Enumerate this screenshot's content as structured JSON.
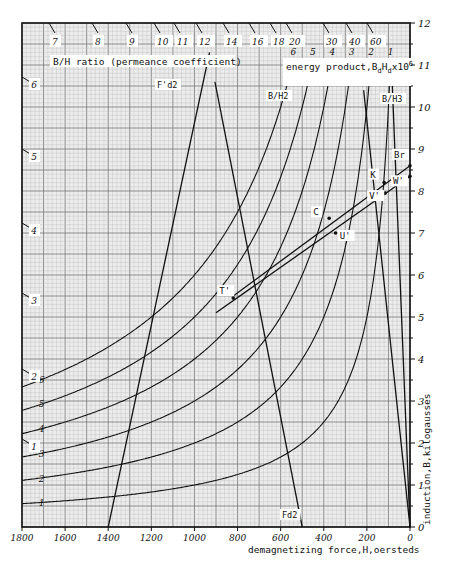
{
  "chart_data": {
    "type": "line",
    "title": "",
    "xlabel": "demagnetizing force,H,oersteds",
    "ylabel": "induction,B,kilogausses",
    "xlim": [
      1800,
      0
    ],
    "ylim": [
      0,
      12
    ],
    "x_ticks": [
      "1800",
      "1600",
      "1400",
      "1200",
      "1000",
      "800",
      "600",
      "400",
      "200",
      "0"
    ],
    "y_ticks": [
      "0",
      "1",
      "2",
      "3",
      "4",
      "5",
      "6",
      "7",
      "8",
      "9",
      "10",
      "11",
      "12"
    ],
    "grid": true,
    "legend_energy": "energy product,BdHdx10^6",
    "legend_bh": "B/H ratio (permeance coefficient)",
    "energy_product_curves": [
      {
        "label": "1",
        "value": 1
      },
      {
        "label": "2",
        "value": 2
      },
      {
        "label": "3",
        "value": 3
      },
      {
        "label": "4",
        "value": 4
      },
      {
        "label": "5",
        "value": 5
      },
      {
        "label": "6",
        "value": 6
      }
    ],
    "bh_ratio_lines_left": [
      "1",
      "2",
      "3",
      "4",
      "5",
      "6"
    ],
    "bh_ratio_lines_top": [
      "7",
      "8",
      "9",
      "10",
      "11",
      "12",
      "14",
      "16",
      "18",
      "20",
      "30",
      "40",
      "60"
    ],
    "series": [
      {
        "name": "demag line Br-T'",
        "points": [
          [
            0,
            8.6
          ],
          [
            820,
            5.5
          ]
        ]
      },
      {
        "name": "recoil line W'-T'",
        "points": [
          [
            0,
            8.35
          ],
          [
            900,
            5.1
          ]
        ]
      },
      {
        "name": "F'd2",
        "points": [
          [
            1400,
            0
          ],
          [
            930,
            11.3
          ]
        ]
      },
      {
        "name": "Fd2",
        "points": [
          [
            500,
            0
          ],
          [
            905,
            10.6
          ]
        ]
      },
      {
        "name": "B/H2",
        "points": [
          [
            0,
            0
          ],
          [
            215,
            10.4
          ]
        ]
      },
      {
        "name": "B/H3",
        "points": [
          [
            0,
            0
          ],
          [
            82,
            10.5
          ]
        ]
      }
    ],
    "points": [
      {
        "label": "Br",
        "H": 0,
        "B": 8.6
      },
      {
        "label": "K",
        "H": 120,
        "B": 8.2
      },
      {
        "label": "W'",
        "H": 0,
        "B": 8.35
      },
      {
        "label": "V'",
        "H": 115,
        "B": 7.95
      },
      {
        "label": "C",
        "H": 375,
        "B": 7.35
      },
      {
        "label": "U'",
        "H": 345,
        "B": 7.0
      },
      {
        "label": "T'",
        "H": 820,
        "B": 5.45
      }
    ],
    "annotations": [
      "F'd2",
      "Fd2",
      "B/H2",
      "B/H3"
    ]
  },
  "labels": {
    "xlabel": "demagnetizing force,H,oersteds",
    "ylabel": "induction,B,kilogausses",
    "bh_title": "B/H ratio (permeance coefficient)",
    "energy_title": "energy product,B",
    "energy_sub_d1": "d",
    "energy_mid": "H",
    "energy_sub_d2": "d",
    "energy_x": "x10",
    "energy_sup": "6",
    "fd2_prime": "F'd2",
    "fd2": "Fd2",
    "bh2": "B/H2",
    "bh3": "B/H3"
  }
}
